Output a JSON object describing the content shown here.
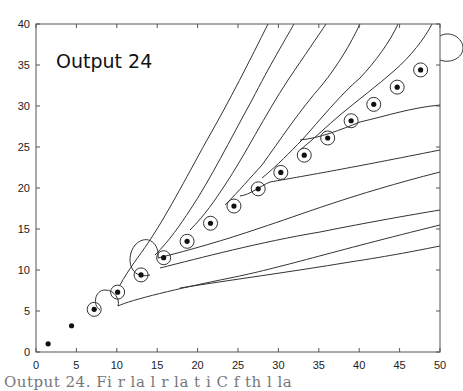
{
  "chart_data": {
    "type": "scatter",
    "title": "Output 24",
    "xlabel": "",
    "ylabel": "",
    "xlim": [
      0,
      50
    ],
    "ylim": [
      0,
      40
    ],
    "xticks": [
      0,
      5,
      10,
      15,
      20,
      25,
      30,
      35,
      40,
      45,
      50
    ],
    "yticks": [
      0,
      5,
      10,
      15,
      20,
      25,
      30,
      35,
      40
    ],
    "grid": false,
    "legend": null,
    "series": [
      {
        "name": "points",
        "marker": "filled-dot",
        "x": [
          1.5,
          4.4,
          7.2,
          10.1,
          13.0,
          15.8,
          18.7,
          21.6,
          24.5,
          27.5,
          30.3,
          33.2,
          36.1,
          39.0,
          41.8,
          44.7,
          47.6
        ],
        "y": [
          1.0,
          3.2,
          5.2,
          7.3,
          9.4,
          11.5,
          13.5,
          15.7,
          17.8,
          19.9,
          21.9,
          24.0,
          26.1,
          28.2,
          30.2,
          32.3,
          34.4
        ]
      }
    ],
    "annotations": [
      "contour lines around points (level curves)",
      "small circles around each point"
    ]
  },
  "caption": "Output 24.  Fi       r  la     l  r     la      t  i  C       f  th         l  la"
}
